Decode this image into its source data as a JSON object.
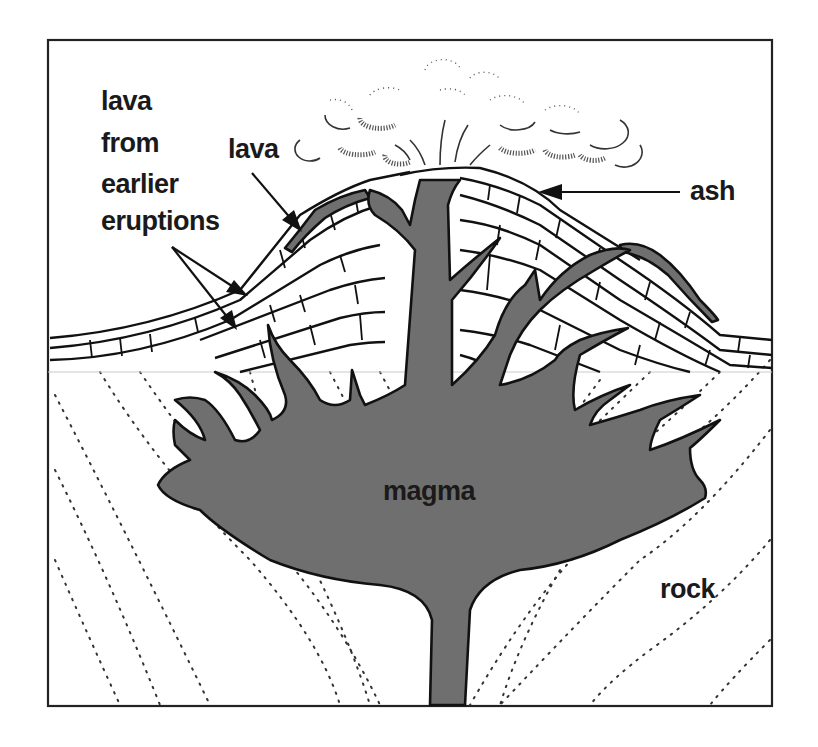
{
  "diagram": {
    "labels": {
      "earlier_lava_line1": "lava",
      "earlier_lava_line2": "from",
      "earlier_lava_line3": "earlier",
      "earlier_lava_line4": "eruptions",
      "lava": "lava",
      "ash": "ash",
      "magma": "magma",
      "rock": "rock"
    },
    "colors": {
      "magma_fill": "#6f6f6f",
      "outline": "#111111",
      "background": "#ffffff"
    },
    "parts": [
      "ash cloud",
      "ash layer",
      "lava layer",
      "layered strata of earlier eruptions",
      "central vent",
      "side vents / dykes",
      "magma chamber",
      "surrounding rock"
    ]
  }
}
